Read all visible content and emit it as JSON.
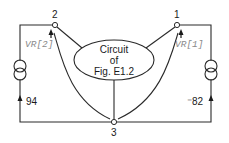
{
  "diagram": {
    "type": "circuit-schematic",
    "central_block": {
      "lines": [
        "Circuit",
        "of",
        "Fig. E1.2"
      ]
    },
    "nodes": [
      {
        "id": "1",
        "label": "1"
      },
      {
        "id": "2",
        "label": "2"
      },
      {
        "id": "3",
        "label": "3"
      }
    ],
    "voltage_labels": {
      "node1": "VR[1]",
      "node2": "VR[2]"
    },
    "current_sources": {
      "left": {
        "value": "94",
        "direction": "up"
      },
      "right": {
        "value": "⁻82",
        "direction": "up"
      }
    },
    "colors": {
      "line": "#2a2a2a",
      "voltage_label": "#8a8a8a",
      "text": "#1a1a1a"
    }
  }
}
